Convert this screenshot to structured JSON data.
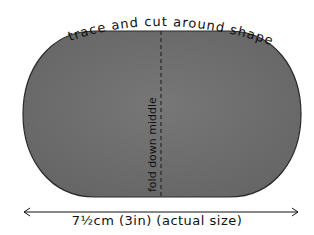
{
  "diagram": {
    "top_label": "trace and cut around shape",
    "fold_label": "fold down middle",
    "dimension_label": "7½cm (3in) (actual size)",
    "shape": "rounded oval (stadium)",
    "colors": {
      "shape_fill": "#6e6e6e",
      "shape_outline": "#2a2a2a",
      "text": "#111111",
      "background": "#ffffff"
    }
  }
}
